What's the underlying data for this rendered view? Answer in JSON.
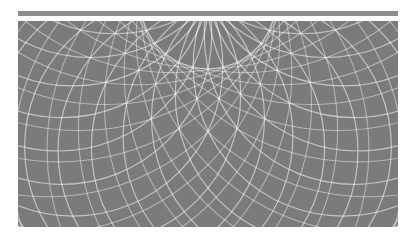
{
  "colors": {
    "background": "#ffffff",
    "bar": "#8c8c8c",
    "panel": "#7b7b7b",
    "stroke": "#ffffff"
  },
  "pattern": {
    "type": "circle-rosette",
    "circle_count": 28,
    "ring_center": [
      190,
      -20
    ],
    "ring_radius": 150,
    "circle_radius": 150,
    "stroke_width": 1.2,
    "stroke_opacity": 0.55
  }
}
